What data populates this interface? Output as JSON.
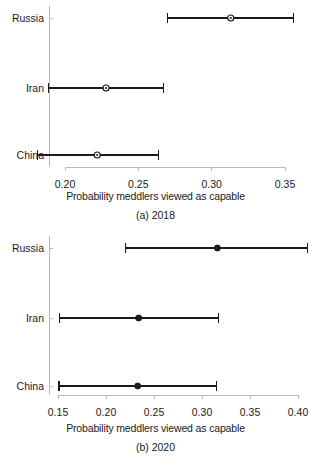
{
  "figure": {
    "width": 311,
    "height": 466,
    "background": "#ffffff",
    "ink_color": "#1a1a1a",
    "axis_color": "#b9b9b9"
  },
  "chart_data": [
    {
      "type": "scatter",
      "orientation": "horizontal",
      "panel_id": "a",
      "title": "",
      "subcaption": "(a) 2018",
      "xlabel": "Probability meddlers viewed as capable",
      "ylabel": "",
      "grid": false,
      "legend": "none",
      "xlim": [
        0.174,
        0.362
      ],
      "xticks": [
        0.2,
        0.25,
        0.3,
        0.35
      ],
      "xticklabels": [
        "0.20",
        "0.25",
        "0.30",
        "0.35"
      ],
      "categories": [
        "China",
        "Iran",
        "Russia"
      ],
      "point_style": "open-circle-with-dot",
      "error_bar_style": "line-with-end-caps",
      "points": [
        {
          "category": "Russia",
          "estimate": 0.313,
          "low": 0.27,
          "high": 0.356
        },
        {
          "category": "Iran",
          "estimate": 0.228,
          "low": 0.189,
          "high": 0.267
        },
        {
          "category": "China",
          "estimate": 0.222,
          "low": 0.181,
          "high": 0.264
        }
      ]
    },
    {
      "type": "scatter",
      "orientation": "horizontal",
      "panel_id": "b",
      "title": "",
      "subcaption": "(b) 2020",
      "xlabel": "Probability meddlers viewed as capable",
      "ylabel": "",
      "grid": false,
      "legend": "none",
      "xlim": [
        0.1435,
        0.4145
      ],
      "xticks": [
        0.15,
        0.2,
        0.25,
        0.3,
        0.35,
        0.4
      ],
      "xticklabels": [
        "0.15",
        "0.20",
        "0.25",
        "0.30",
        "0.35",
        "0.40"
      ],
      "categories": [
        "China",
        "Iran",
        "Russia"
      ],
      "point_style": "filled-circle",
      "error_bar_style": "line-with-end-caps",
      "points": [
        {
          "category": "Russia",
          "estimate": 0.316,
          "low": 0.22,
          "high": 0.41
        },
        {
          "category": "Iran",
          "estimate": 0.234,
          "low": 0.152,
          "high": 0.317
        },
        {
          "category": "China",
          "estimate": 0.233,
          "low": 0.151,
          "high": 0.315
        }
      ]
    }
  ],
  "panel_a": {
    "subcaption": "(a) 2018",
    "xlabel": "Probability meddlers viewed as capable",
    "ticks": [
      "0.20",
      "0.25",
      "0.30",
      "0.35"
    ],
    "categories": [
      "Russia",
      "Iran",
      "China"
    ]
  },
  "panel_b": {
    "subcaption": "(b) 2020",
    "xlabel": "Probability meddlers viewed as capable",
    "ticks": [
      "0.15",
      "0.20",
      "0.25",
      "0.30",
      "0.35",
      "0.40"
    ],
    "categories": [
      "Russia",
      "Iran",
      "China"
    ]
  }
}
